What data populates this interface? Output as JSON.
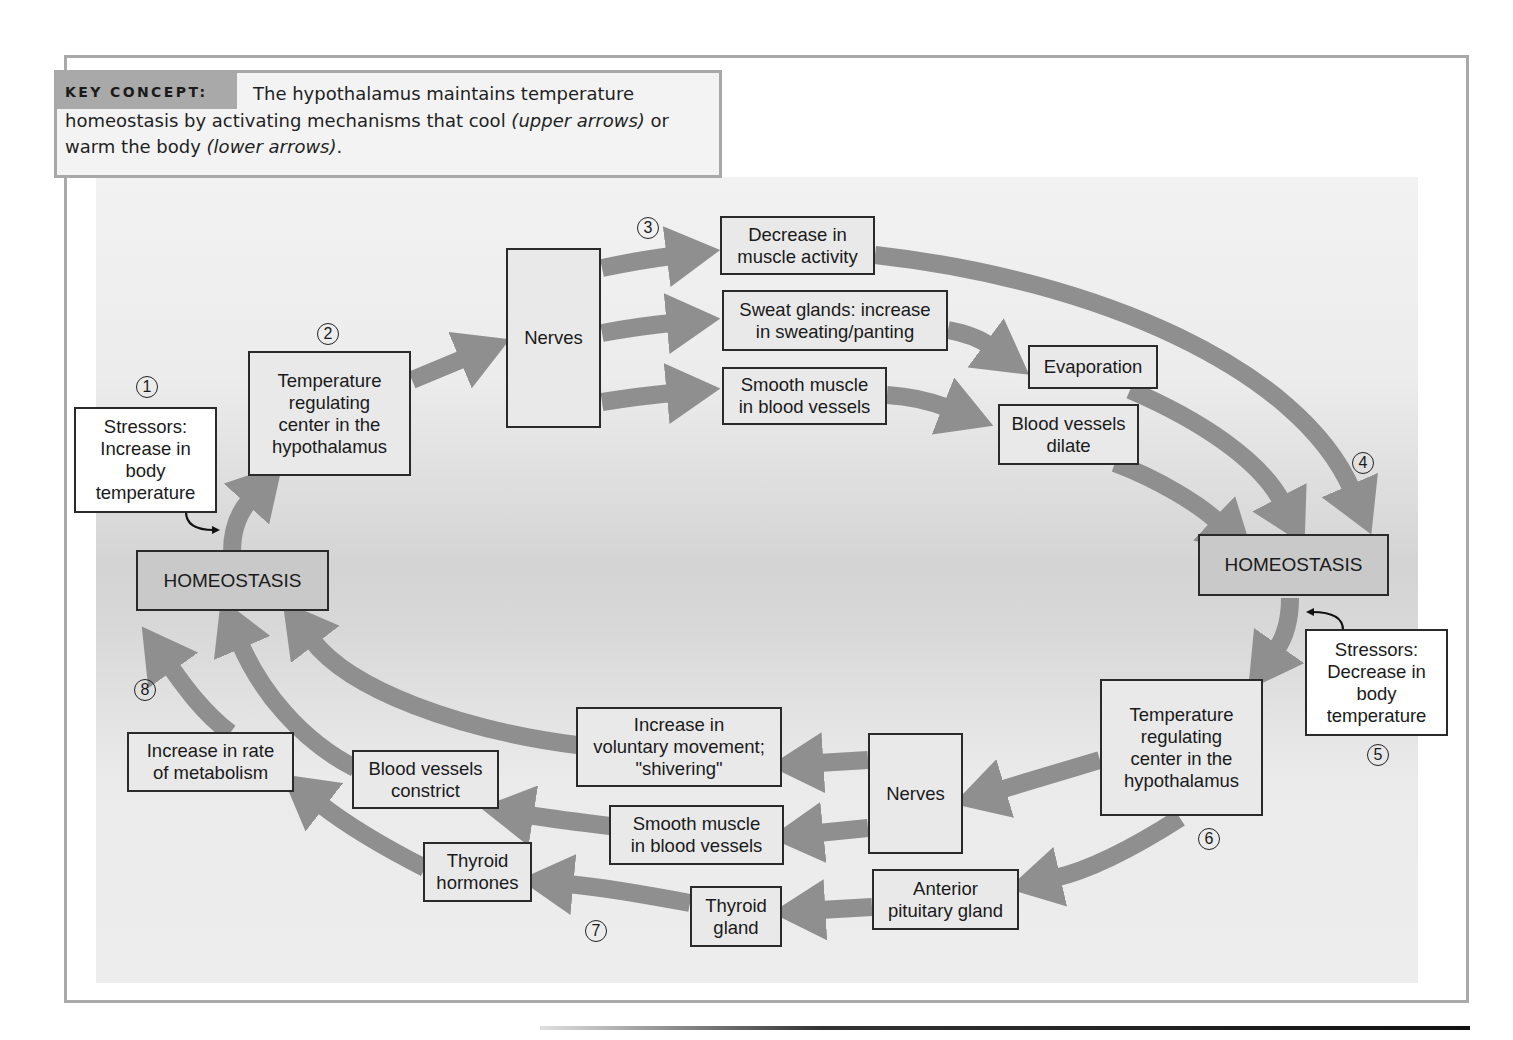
{
  "key_concept": {
    "label": "KEY CONCEPT:",
    "text_1": "The hypothalamus maintains temperature homeostasis by activating mechanisms that cool ",
    "italic_1": "(upper arrows)",
    "text_2": " or warm the body ",
    "italic_2": "(lower arrows)",
    "text_3": "."
  },
  "colors": {
    "arrow": "#8f8f8f",
    "box_fill": "#e9e9e9",
    "homeostasis_fill": "#c9c9c9",
    "border": "#2a2a2a",
    "frame": "#a9a9a9"
  },
  "steps": [
    "1",
    "2",
    "3",
    "4",
    "5",
    "6",
    "7",
    "8"
  ],
  "cooling_pathway": {
    "stressor": "Stressors:\nIncrease in\nbody\ntemperature",
    "homeostasis_left": "HOMEOSTASIS",
    "control_center": "Temperature\nregulating\ncenter in the\nhypothalamus",
    "nerves": "Nerves",
    "effectors": [
      "Decrease in\nmuscle activity",
      "Sweat glands: increase\nin sweating/panting",
      "Smooth muscle\nin blood vessels"
    ],
    "responses": [
      "Evaporation",
      "Blood vessels\ndilate"
    ],
    "homeostasis_right": "HOMEOSTASIS"
  },
  "warming_pathway": {
    "stressor": "Stressors:\nDecrease in\nbody\ntemperature",
    "control_center": "Temperature\nregulating\ncenter in the\nhypothalamus",
    "nerves": "Nerves",
    "anterior_pituitary": "Anterior\npituitary gland",
    "effectors": [
      "Increase in\nvoluntary movement;\n\"shivering\"",
      "Smooth muscle\nin blood vessels",
      "Thyroid\ngland"
    ],
    "responses": [
      "Blood vessels\nconstrict",
      "Thyroid\nhormones",
      "Increase in rate\nof metabolism"
    ]
  }
}
